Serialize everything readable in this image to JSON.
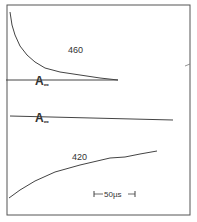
{
  "chart_data": {
    "type": "line",
    "title": "",
    "xlabel": "",
    "ylabel": "",
    "grid": false,
    "legend": "none",
    "scale_bar": {
      "label": "50 µs",
      "display": "|←50µs→|"
    },
    "panels": [
      {
        "name": "460",
        "label": "460",
        "baseline_label": "A∞",
        "description": "decay trace approaching baseline A∞",
        "points": [
          [
            10,
            12
          ],
          [
            12,
            25
          ],
          [
            15,
            35
          ],
          [
            20,
            46
          ],
          [
            27,
            55
          ],
          [
            35,
            62
          ],
          [
            45,
            68
          ],
          [
            60,
            72
          ],
          [
            80,
            75
          ],
          [
            100,
            78
          ],
          [
            118,
            80
          ]
        ],
        "baseline": [
          [
            6,
            80
          ],
          [
            118,
            80
          ]
        ]
      },
      {
        "name": "420",
        "label": "420",
        "baseline_label": "A∞",
        "description": "rising trace below baseline A∞",
        "points": [
          [
            9,
            198
          ],
          [
            20,
            190
          ],
          [
            35,
            181
          ],
          [
            55,
            172
          ],
          [
            80,
            165
          ],
          [
            110,
            158
          ],
          [
            125,
            157
          ],
          [
            140,
            154
          ],
          [
            157,
            151
          ]
        ],
        "baseline": [
          [
            10,
            116
          ],
          [
            173,
            120
          ]
        ]
      }
    ]
  },
  "labels": {
    "trace_460": "460",
    "trace_420": "420",
    "a_inf_sym": "A",
    "a_inf_sub": "∞",
    "scale_bar": "50µs"
  },
  "colors": {
    "line": "#444444",
    "frame": "#555555",
    "background": "#ffffff"
  }
}
